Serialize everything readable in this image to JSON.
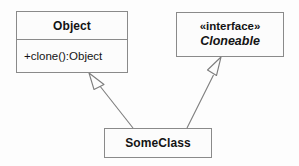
{
  "diagram": {
    "type": "uml-class-diagram",
    "title": "",
    "canvas": {
      "width": 299,
      "height": 166,
      "background": "#fdfdfd"
    },
    "style": {
      "box_fill": "#fcfcfc",
      "box_border": "#8a8a8a",
      "line_color": "#7d7d7d",
      "text_color": "#141414",
      "arrowhead": "hollow-triangle"
    }
  },
  "classes": {
    "object": {
      "name": "Object",
      "operations": [
        "+clone():Object"
      ]
    },
    "cloneable": {
      "stereotype": "«interface»",
      "name": "Cloneable"
    },
    "someclass": {
      "name": "SomeClass"
    }
  },
  "relationships": [
    {
      "id": "generalization-someclass-object",
      "kind": "generalization",
      "label": "",
      "source": "SomeClass",
      "target": "Object",
      "line": "solid",
      "arrowhead": "hollow-triangle"
    },
    {
      "id": "realization-someclass-cloneable",
      "kind": "realization",
      "label": "",
      "source": "SomeClass",
      "target": "Cloneable",
      "line": "solid",
      "arrowhead": "hollow-triangle"
    }
  ]
}
